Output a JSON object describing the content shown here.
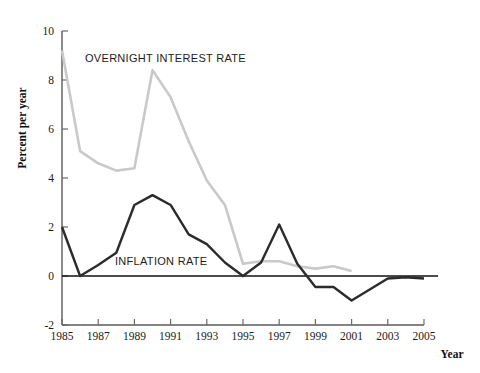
{
  "chart_data": {
    "type": "line",
    "title": "",
    "xlabel": "Year",
    "ylabel": "Percent per year",
    "xlim": [
      1985,
      2005
    ],
    "ylim": [
      -2,
      10
    ],
    "grid": false,
    "legend_position": "inline-annotations",
    "xticks": [
      1985,
      1987,
      1989,
      1991,
      1993,
      1995,
      1997,
      1999,
      2001,
      2003,
      2005
    ],
    "xtick_labels": [
      "1985",
      "1987",
      "1989",
      "1991",
      "1993",
      "1995",
      "1997",
      "1999",
      "2001",
      "2003",
      "2005"
    ],
    "yticks": [
      -2,
      0,
      2,
      4,
      6,
      8,
      10
    ],
    "ytick_labels": [
      "-2",
      "0",
      "2",
      "4",
      "6",
      "8",
      "10"
    ],
    "series": [
      {
        "name": "OVERNIGHT INTEREST RATE",
        "color": "#c9c9c9",
        "x": [
          1985,
          1986,
          1987,
          1988,
          1989,
          1990,
          1991,
          1992,
          1993,
          1994,
          1995,
          1996,
          1997,
          1998,
          1999,
          2000,
          2001
        ],
        "values": [
          9.2,
          5.1,
          4.6,
          4.3,
          4.4,
          8.4,
          7.3,
          5.5,
          3.9,
          2.9,
          0.5,
          0.6,
          0.6,
          0.4,
          0.3,
          0.4,
          0.2
        ]
      },
      {
        "name": "INFLATION RATE",
        "color": "#2b2b2b",
        "x": [
          1985,
          1986,
          1987,
          1988,
          1989,
          1990,
          1991,
          1992,
          1993,
          1994,
          1995,
          1996,
          1997,
          1998,
          1999,
          2000,
          2001,
          2002,
          2003,
          2004,
          2005
        ],
        "values": [
          2.0,
          0.0,
          0.45,
          0.95,
          2.9,
          3.3,
          2.9,
          1.7,
          1.3,
          0.55,
          0.0,
          0.55,
          2.1,
          0.5,
          -0.45,
          -0.45,
          -1.0,
          -0.55,
          -0.1,
          -0.05,
          -0.1
        ]
      }
    ],
    "annotations": [
      {
        "text": "OVERNIGHT INTEREST RATE",
        "x_px": 85,
        "y_px": 62
      },
      {
        "text": "INFLATION RATE",
        "x_px": 115,
        "y_px": 265
      }
    ]
  }
}
